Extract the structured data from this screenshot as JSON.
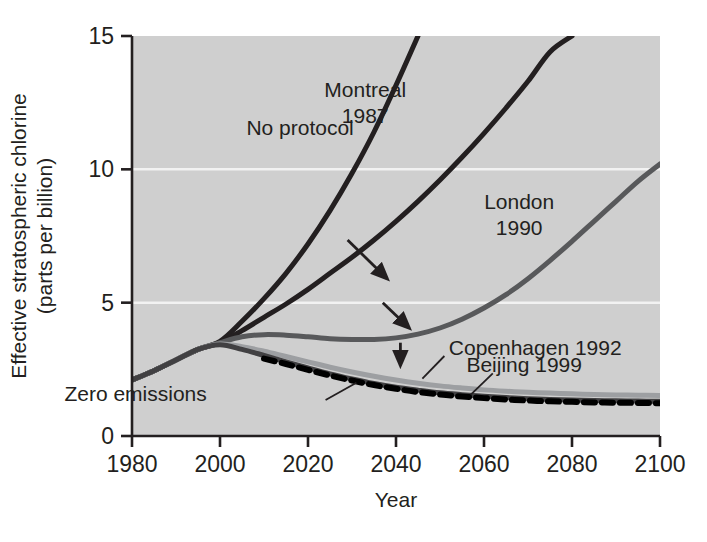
{
  "chart_data": {
    "type": "line",
    "title": "",
    "xlabel": "Year",
    "ylabel": "Effective stratospheric chlorine (parts per billion)",
    "ylabel_line1": "Effective stratospheric chlorine",
    "ylabel_line2": "(parts per billion)",
    "xlim": [
      1980,
      2100
    ],
    "ylim": [
      0,
      15
    ],
    "xticks": [
      1980,
      2000,
      2020,
      2040,
      2060,
      2080,
      2100
    ],
    "xtick_labels": [
      "1980",
      "2000",
      "2020",
      "2040",
      "2060",
      "2080",
      "2100"
    ],
    "yticks": [
      0,
      5,
      10,
      15
    ],
    "ytick_labels": [
      "0",
      "5",
      "10",
      "15"
    ],
    "grid": "horizontal-white-gridlines-at-5-and-10",
    "legend_position": "inline-annotations",
    "plot_background": "#cfcfcf",
    "x": [
      1980,
      1985,
      1990,
      1995,
      2000,
      2005,
      2010,
      2015,
      2020,
      2025,
      2030,
      2035,
      2040,
      2045,
      2050,
      2055,
      2060,
      2065,
      2070,
      2075,
      2080,
      2085,
      2090,
      2095,
      2100
    ],
    "series": [
      {
        "name": "No protocol",
        "color": "#231f20",
        "style": "solid",
        "width": 5,
        "values": [
          2.1,
          2.45,
          2.85,
          3.25,
          3.55,
          4.3,
          5.15,
          6.1,
          7.2,
          8.45,
          9.85,
          11.4,
          13.15,
          15.0,
          null,
          null,
          null,
          null,
          null,
          null,
          null,
          null,
          null,
          null,
          null
        ],
        "label_x": 2006,
        "label_y": 11.3,
        "exits_top_at_year": 2041
      },
      {
        "name": "Montreal 1987",
        "label_line1": "Montreal",
        "label_line2": "1987",
        "color": "#231f20",
        "style": "solid",
        "width": 5,
        "values": [
          2.1,
          2.45,
          2.85,
          3.25,
          3.5,
          3.95,
          4.45,
          4.95,
          5.5,
          6.1,
          6.7,
          7.35,
          8.05,
          8.8,
          9.6,
          10.45,
          11.35,
          12.3,
          13.3,
          14.4,
          15.0,
          null,
          null,
          null,
          null
        ],
        "label_x": 2033,
        "label_y": 12.7,
        "exits_top_at_year": 2076
      },
      {
        "name": "London 1990",
        "label_line1": "London",
        "label_line2": "1990",
        "color": "#58595b",
        "style": "solid",
        "width": 5,
        "values": [
          2.1,
          2.45,
          2.85,
          3.25,
          3.5,
          3.72,
          3.8,
          3.78,
          3.72,
          3.65,
          3.62,
          3.62,
          3.68,
          3.82,
          4.05,
          4.38,
          4.8,
          5.3,
          5.9,
          6.58,
          7.3,
          8.05,
          8.8,
          9.55,
          10.2
        ],
        "label_x": 2068,
        "label_y": 8.5
      },
      {
        "name": "Copenhagen 1992",
        "color": "#9d9fa2",
        "style": "solid",
        "width": 5,
        "values": [
          2.1,
          2.45,
          2.85,
          3.25,
          3.45,
          3.35,
          3.18,
          2.98,
          2.78,
          2.58,
          2.4,
          2.24,
          2.1,
          1.98,
          1.88,
          1.8,
          1.73,
          1.68,
          1.64,
          1.61,
          1.58,
          1.56,
          1.54,
          1.53,
          1.52
        ],
        "label_x": 2052,
        "label_y": 3.05
      },
      {
        "name": "Beijing 1999",
        "color": "#414042",
        "style": "solid",
        "width": 5,
        "values": [
          2.1,
          2.45,
          2.85,
          3.25,
          3.42,
          3.25,
          3.02,
          2.78,
          2.55,
          2.33,
          2.14,
          1.97,
          1.83,
          1.72,
          1.62,
          1.55,
          1.49,
          1.44,
          1.4,
          1.37,
          1.35,
          1.33,
          1.32,
          1.31,
          1.3
        ],
        "label_x": 2056,
        "label_y": 2.4
      },
      {
        "name": "Zero emissions",
        "color": "#000000",
        "style": "dashed",
        "width": 6,
        "values": [
          null,
          null,
          null,
          null,
          null,
          null,
          2.9,
          2.7,
          2.48,
          2.27,
          2.08,
          1.91,
          1.77,
          1.65,
          1.56,
          1.48,
          1.42,
          1.37,
          1.33,
          1.3,
          1.28,
          1.26,
          1.25,
          1.24,
          1.23
        ],
        "label_x": 1997,
        "label_y": 1.3
      }
    ],
    "annotations": [
      {
        "name": "arrow-no-protocol-to-montreal",
        "from": [
          2029,
          7.35
        ],
        "to": [
          2038,
          5.9
        ]
      },
      {
        "name": "arrow-montreal-to-london",
        "from": [
          2037,
          5.0
        ],
        "to": [
          2043,
          4.05
        ]
      },
      {
        "name": "arrow-london-to-copenhagen",
        "from": [
          2041,
          3.5
        ],
        "to": [
          2041,
          2.65
        ]
      },
      {
        "name": "leader-copenhagen",
        "from": [
          2046,
          2.15
        ],
        "to": [
          2051,
          3.0
        ]
      },
      {
        "name": "leader-beijing",
        "from": [
          2057,
          1.55
        ],
        "to": [
          2062,
          2.35
        ]
      },
      {
        "name": "leader-zero-emissions",
        "from": [
          2024,
          1.35
        ],
        "to": [
          2031,
          2.0
        ]
      }
    ]
  }
}
